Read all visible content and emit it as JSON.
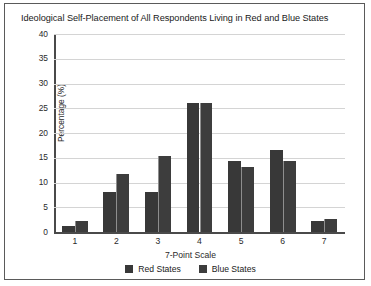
{
  "chart_data": {
    "type": "bar",
    "title": "Ideological Self-Placement of All Respondents Living in Red and Blue States",
    "xlabel": "7-Point Scale",
    "ylabel": "Percentage (%)",
    "categories": [
      "1",
      "2",
      "3",
      "4",
      "5",
      "6",
      "7"
    ],
    "series": [
      {
        "name": "Red States",
        "color": "#383838",
        "values": [
          1.3,
          8.0,
          8.0,
          26.0,
          14.3,
          16.5,
          2.3
        ]
      },
      {
        "name": "Blue States",
        "color": "#3d3d3d",
        "values": [
          2.2,
          11.8,
          15.3,
          26.0,
          13.2,
          14.3,
          2.6
        ]
      }
    ],
    "ylim": [
      0,
      40
    ],
    "yticks": [
      "0",
      "5",
      "10",
      "15",
      "20",
      "25",
      "30",
      "35",
      "40"
    ],
    "grid": true,
    "legend_position": "bottom"
  }
}
